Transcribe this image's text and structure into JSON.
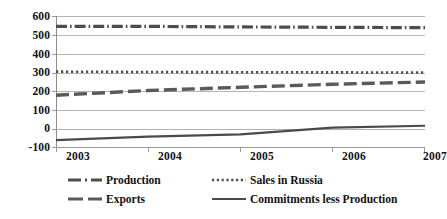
{
  "chart_data": {
    "type": "line",
    "title": "",
    "xlabel": "",
    "ylabel": "",
    "x": [
      "2003",
      "2004",
      "2005",
      "2006",
      "2007"
    ],
    "categories": [
      "2003",
      "2004",
      "2005",
      "2006",
      "2007"
    ],
    "ylim": [
      -100,
      600
    ],
    "yticks": [
      600,
      500,
      400,
      300,
      200,
      100,
      0,
      -100
    ],
    "ytick_labels": [
      "600",
      "500",
      "400",
      "300",
      "200",
      "100",
      "0",
      "-100"
    ],
    "grid": true,
    "legend_position": "bottom",
    "series": [
      {
        "name": "Production",
        "style": "dash-dot",
        "color": "#4d4d4d",
        "values": [
          545,
          545,
          542,
          540,
          538
        ]
      },
      {
        "name": "Sales in Russia",
        "style": "dotted",
        "color": "#4d4d4d",
        "values": [
          305,
          303,
          302,
          301,
          300
        ]
      },
      {
        "name": "Exports",
        "style": "dashed",
        "color": "#5a5a5a",
        "values": [
          180,
          205,
          222,
          238,
          250
        ]
      },
      {
        "name": "Commitments less Production",
        "style": "solid",
        "color": "#4a4a4a",
        "values": [
          -58,
          -40,
          -28,
          8,
          18
        ]
      }
    ]
  },
  "axes": {
    "y_tick_labels": [
      "600",
      "500",
      "400",
      "300",
      "200",
      "100",
      "0",
      "-100"
    ],
    "x_tick_labels": [
      "2003",
      "2004",
      "2005",
      "2006",
      "2007"
    ]
  },
  "legend": {
    "items": [
      {
        "label": "Production",
        "style": "dash-dot"
      },
      {
        "label": "Exports",
        "style": "dashed"
      },
      {
        "label": "Sales in Russia",
        "style": "dotted"
      },
      {
        "label": "Commitments less Production",
        "style": "solid"
      }
    ]
  },
  "colors": {
    "gridline": "#b4b4b4",
    "axis": "#9a9a9a",
    "series_gray": "#4d4d4d",
    "background": "#ffffff"
  }
}
